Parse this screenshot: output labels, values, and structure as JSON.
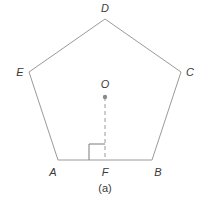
{
  "diagram": {
    "type": "regular-pentagon",
    "caption": "(a)",
    "colors": {
      "line": "#9a9a9a",
      "text": "#3a3a3a",
      "center_dot": "#8a8a8a"
    },
    "vertices": [
      {
        "id": "A",
        "label": "A",
        "x": 58,
        "y": 160,
        "lx": 52,
        "ly": 176
      },
      {
        "id": "B",
        "label": "B",
        "x": 152,
        "y": 160,
        "lx": 156,
        "ly": 176
      },
      {
        "id": "C",
        "label": "C",
        "x": 181,
        "y": 72,
        "lx": 188,
        "ly": 76
      },
      {
        "id": "D",
        "label": "D",
        "x": 105,
        "y": 19,
        "lx": 105,
        "ly": 12
      },
      {
        "id": "E",
        "label": "E",
        "x": 29,
        "y": 72,
        "lx": 20,
        "ly": 76
      }
    ],
    "center": {
      "label": "O",
      "x": 105,
      "y": 97,
      "lx": 105,
      "ly": 87
    },
    "foot": {
      "label": "F",
      "x": 105,
      "y": 160,
      "lx": 105,
      "ly": 176
    },
    "perpendicular": {
      "from": "O",
      "to": "F",
      "style": "dashed"
    },
    "right_angle_marker": {
      "at": "F",
      "size": 16
    }
  }
}
